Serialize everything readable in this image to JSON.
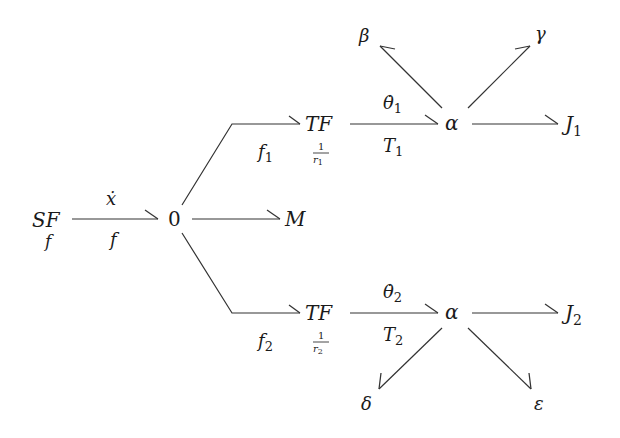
{
  "diagram": {
    "type": "bond-graph",
    "nodes": {
      "source": {
        "label": "SF",
        "sublabel": "f"
      },
      "junction0": {
        "label": "0"
      },
      "mass": {
        "label": "M"
      },
      "tf1": {
        "label": "TF",
        "ratio_num": "1",
        "ratio_den": "r",
        "ratio_den_sub": "1"
      },
      "tf2": {
        "label": "TF",
        "ratio_num": "1",
        "ratio_den": "r",
        "ratio_den_sub": "2"
      },
      "alpha1": {
        "label": "α"
      },
      "alpha2": {
        "label": "α"
      },
      "beta": {
        "label": "β"
      },
      "gamma": {
        "label": "γ"
      },
      "j1": {
        "label": "J",
        "sub": "1"
      },
      "j2": {
        "label": "J",
        "sub": "2"
      },
      "delta": {
        "label": "δ"
      },
      "epsilon": {
        "label": "ε"
      }
    },
    "bonds": {
      "sf_to_0": {
        "top": "ẋ",
        "bottom": "f"
      },
      "zero_to_tf1": {
        "bottom": "f",
        "bottom_sub": "1"
      },
      "zero_to_tf2": {
        "bottom": "f",
        "bottom_sub": "2"
      },
      "tf1_to_alpha1": {
        "top": "θ̇",
        "top_sub": "1",
        "bottom": "T",
        "bottom_sub": "1"
      },
      "tf2_to_alpha2": {
        "top": "θ̇",
        "top_sub": "2",
        "bottom": "T",
        "bottom_sub": "2"
      }
    },
    "colors": {
      "line": "#333333",
      "text": "#1a1a1a",
      "background": "#ffffff"
    }
  }
}
